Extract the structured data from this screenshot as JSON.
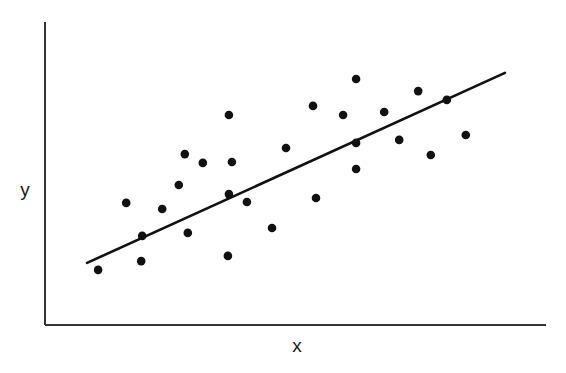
{
  "chart_data": {
    "type": "scatter",
    "title": "",
    "xlabel": "x",
    "ylabel": "y",
    "xlim": [
      0,
      100
    ],
    "ylim": [
      0,
      100
    ],
    "grid": false,
    "legend": null,
    "ticks": "none",
    "note": "No tick labels shown; values normalized to 0-100 within plot area",
    "series": [
      {
        "name": "observations",
        "marker": "filled-circle",
        "color": "#111111",
        "points": [
          {
            "x": 10.6,
            "y": 18.2
          },
          {
            "x": 16.2,
            "y": 40.3
          },
          {
            "x": 19.2,
            "y": 21.1
          },
          {
            "x": 19.4,
            "y": 29.4
          },
          {
            "x": 23.4,
            "y": 38.3
          },
          {
            "x": 26.7,
            "y": 46.2
          },
          {
            "x": 27.9,
            "y": 56.4
          },
          {
            "x": 28.5,
            "y": 30.4
          },
          {
            "x": 31.5,
            "y": 53.5
          },
          {
            "x": 36.5,
            "y": 22.8
          },
          {
            "x": 36.7,
            "y": 43.2
          },
          {
            "x": 37.3,
            "y": 53.8
          },
          {
            "x": 36.7,
            "y": 69.3
          },
          {
            "x": 40.3,
            "y": 40.6
          },
          {
            "x": 45.3,
            "y": 32.0
          },
          {
            "x": 48.1,
            "y": 58.4
          },
          {
            "x": 54.1,
            "y": 41.9
          },
          {
            "x": 53.5,
            "y": 72.3
          },
          {
            "x": 59.5,
            "y": 69.3
          },
          {
            "x": 62.1,
            "y": 81.2
          },
          {
            "x": 62.1,
            "y": 60.1
          },
          {
            "x": 62.1,
            "y": 51.5
          },
          {
            "x": 67.7,
            "y": 70.3
          },
          {
            "x": 70.7,
            "y": 61.1
          },
          {
            "x": 74.5,
            "y": 77.2
          },
          {
            "x": 77.0,
            "y": 56.1
          },
          {
            "x": 80.2,
            "y": 74.3
          },
          {
            "x": 84.0,
            "y": 62.7
          }
        ]
      }
    ],
    "trendline": {
      "type": "linear",
      "color": "#111111",
      "start": {
        "x": 8.4,
        "y": 20.5
      },
      "end": {
        "x": 91.8,
        "y": 83.2
      }
    }
  },
  "render": {
    "axis_color": "#333333",
    "point_color": "#111111",
    "line_color": "#111111",
    "plot_px": {
      "left": 45,
      "right": 546,
      "top": 22,
      "bottom": 325
    }
  }
}
